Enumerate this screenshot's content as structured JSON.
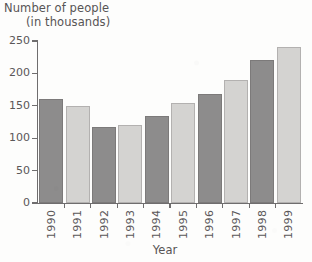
{
  "chart_data": {
    "type": "bar",
    "title": "Number of people (in thousands)",
    "title_line_1": "Number of people",
    "title_line_2": "(in thousands)",
    "xlabel": "Year",
    "ylabel": "",
    "categories": [
      "1990",
      "1991",
      "1992",
      "1993",
      "1994",
      "1995",
      "1996",
      "1997",
      "1998",
      "1999"
    ],
    "values": [
      161,
      149,
      118,
      121,
      135,
      154,
      169,
      190,
      220,
      240
    ],
    "ylim": [
      0,
      250
    ],
    "yticks": [
      0,
      50,
      100,
      150,
      200,
      250
    ],
    "ytick_labels": [
      "0",
      "50",
      "100",
      "150",
      "200",
      "250"
    ],
    "grid": false,
    "legend": null,
    "bar_colors": [
      "#8d8c8c",
      "#d4d3d1",
      "#8d8c8c",
      "#d4d3d1",
      "#8d8c8c",
      "#d4d3d1",
      "#8d8c8c",
      "#d4d3d1",
      "#8d8c8c",
      "#d4d3d1"
    ],
    "colors": {
      "bar_dark": "#8d8c8c",
      "bar_light": "#d4d3d1",
      "axis": "#6f6d6e",
      "text": "#575455",
      "background": "#fdfdfc"
    }
  }
}
